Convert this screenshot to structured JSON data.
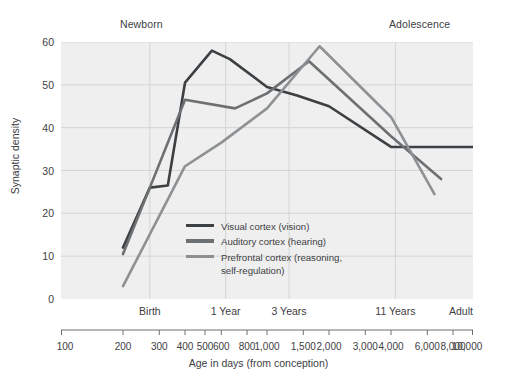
{
  "chart_data": {
    "type": "line",
    "title": "",
    "xlabel": "Age in days (from conception)",
    "ylabel": "Synaptic density",
    "xscale": "log",
    "xlim": [
      100,
      10000
    ],
    "ylim": [
      0,
      60
    ],
    "grid": true,
    "legend_position": "inside-bottom-left",
    "x_tick_labels": [
      "100",
      "200",
      "300",
      "400",
      "500",
      "600",
      "800",
      "1,000",
      "1,500",
      "2,000",
      "3,000",
      "4,000",
      "6,000",
      "8,000",
      "10,000"
    ],
    "x_tick_values": [
      100,
      200,
      300,
      400,
      500,
      600,
      800,
      1000,
      1500,
      2000,
      3000,
      4000,
      6000,
      8000,
      10000
    ],
    "y_tick_labels": [
      "0",
      "10",
      "20",
      "30",
      "40",
      "50",
      "60"
    ],
    "y_tick_values": [
      0,
      10,
      20,
      30,
      40,
      50,
      60
    ],
    "phase_labels": [
      {
        "label": "Birth",
        "x": 270
      },
      {
        "label": "1 Year",
        "x": 630
      },
      {
        "label": "3 Years",
        "x": 1280
      },
      {
        "label": "11 Years",
        "x": 4200
      },
      {
        "label": "Adult",
        "x": 10000
      }
    ],
    "annotations": [
      {
        "label": "Newborn",
        "x": 240
      },
      {
        "label": "Adolescence",
        "x": 5200
      }
    ],
    "series": [
      {
        "name": "Visual cortex (vision)",
        "color": "#3d4043",
        "points": [
          [
            200,
            12.0
          ],
          [
            270,
            26.0
          ],
          [
            330,
            26.5
          ],
          [
            400,
            50.5
          ],
          [
            540,
            58.0
          ],
          [
            660,
            56.0
          ],
          [
            1000,
            49.5
          ],
          [
            1400,
            47.5
          ],
          [
            2000,
            45.0
          ],
          [
            4000,
            35.5
          ],
          [
            10000,
            35.5
          ]
        ]
      },
      {
        "name": "Auditory cortex (hearing)",
        "color": "#6d7072",
        "points": [
          [
            200,
            10.5
          ],
          [
            270,
            26.0
          ],
          [
            400,
            46.5
          ],
          [
            700,
            44.5
          ],
          [
            1000,
            48.0
          ],
          [
            1600,
            55.5
          ],
          [
            4000,
            38.0
          ],
          [
            7000,
            28.0
          ]
        ]
      },
      {
        "name": "Prefrontal cortex (reasoning,\nself-regulation)",
        "color": "#8e9193",
        "points": [
          [
            200,
            3.0
          ],
          [
            400,
            31.0
          ],
          [
            600,
            36.5
          ],
          [
            1000,
            44.5
          ],
          [
            1800,
            59.0
          ],
          [
            4000,
            42.5
          ],
          [
            6500,
            24.5
          ]
        ]
      }
    ]
  },
  "legend": [
    {
      "label": "Visual cortex (vision)",
      "color": "#3d4043"
    },
    {
      "label": "Auditory cortex (hearing)",
      "color": "#6d7072"
    },
    {
      "label": "Prefrontal cortex (reasoning,\nself-regulation)",
      "color": "#8e9193"
    }
  ],
  "colors": {
    "plot_background": "#efefef",
    "grid": "#d4d4d4",
    "axis": "#6b6e70",
    "text": "#3d4043"
  }
}
